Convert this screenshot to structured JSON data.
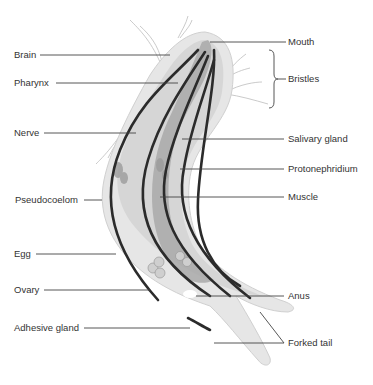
{
  "diagram": {
    "labels": {
      "brain": "Brain",
      "pharynx": "Pharynx",
      "nerve": "Nerve",
      "pseudocoelom": "Pseudocoelom",
      "egg": "Egg",
      "ovary": "Ovary",
      "adhesive_gland": "Adhesive gland",
      "mouth": "Mouth",
      "bristles": "Bristles",
      "salivary_gland": "Salivary gland",
      "protonephridium": "Protonephridium",
      "muscle": "Muscle",
      "anus": "Anus",
      "forked_tail": "Forked tail"
    },
    "colors": {
      "body_outer": "#e6e6e6",
      "body_inner": "#d4d4d4",
      "gut": "#a9a9a9",
      "muscle": "#2b2b2b",
      "text": "#333333",
      "leader": "#444444"
    }
  }
}
